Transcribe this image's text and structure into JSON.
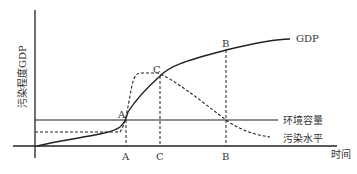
{
  "diagram": {
    "y_axis_label": "污染程度GDP",
    "x_axis_label": "时间",
    "curves": {
      "gdp": {
        "label": "GDP"
      },
      "capacity": {
        "label": "环境容量"
      },
      "pollution": {
        "label": "污染水平"
      }
    },
    "points": {
      "A": "A",
      "B": "B",
      "C": "C"
    },
    "x_ticks": [
      "A",
      "C",
      "B"
    ],
    "colors": {
      "line": "#222222",
      "text": "#333333"
    }
  }
}
